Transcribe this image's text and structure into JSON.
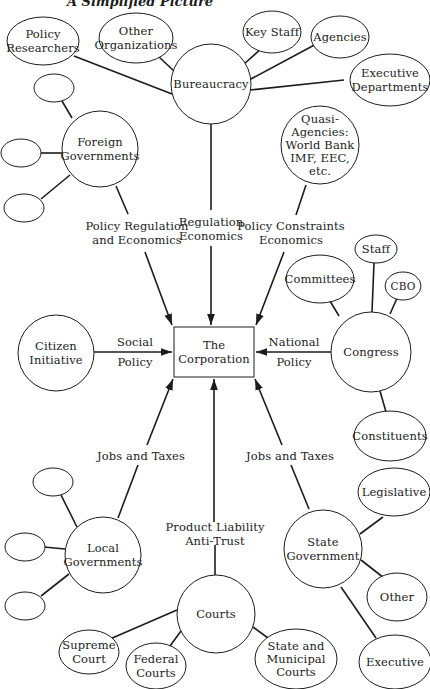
{
  "title": "A Simplified Picture",
  "center": {
    "label": "The\nCorporation"
  },
  "nodes": {
    "bureaucracy": "Bureaucracy",
    "policy_researchers": "Policy\nResearchers",
    "other_organizations": "Other\nOrganizations",
    "key_staff": "Key Staff",
    "agencies": "Agencies",
    "executive_departments": "Executive\nDepartments",
    "foreign_governments": "Foreign\nGovernments",
    "quasi_agencies": "Quasi-\nAgencies:\nWorld Bank\nIMF, EEC,\netc.",
    "citizen_initiative": "Citizen\nInitiative",
    "congress": "Congress",
    "committees": "Committees",
    "staff": "Staff",
    "cbo": "CBO",
    "constituents": "Constituents",
    "local_governments": "Local\nGovernments",
    "courts": "Courts",
    "supreme_court": "Supreme\nCourt",
    "federal_courts": "Federal\nCourts",
    "state_municipal_courts": "State and\nMunicipal\nCourts",
    "state_government": "State\nGovernment",
    "legislative": "Legislative",
    "other": "Other",
    "executive": "Executive"
  },
  "edges": {
    "bureaucracy": "Regulation\nEconomics",
    "foreign_governments": "Policy Regulation\nand Economics",
    "quasi_agencies": "Policy Constraints\nEconomics",
    "citizen_initiative_top": "Social",
    "citizen_initiative_bottom": "Policy",
    "congress_top": "National",
    "congress_bottom": "Policy",
    "local_governments": "Jobs and Taxes",
    "state_government": "Jobs and Taxes",
    "courts": "Product Liability\nAnti-Trust"
  }
}
